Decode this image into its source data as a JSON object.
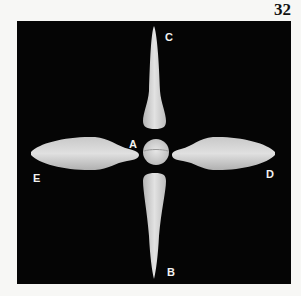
{
  "page": {
    "number": "32"
  },
  "figure": {
    "background_color": "#050505",
    "object_color": "#d8d8d8",
    "labels": {
      "A": "A",
      "B": "B",
      "C": "C",
      "D": "D",
      "E": "E"
    }
  }
}
